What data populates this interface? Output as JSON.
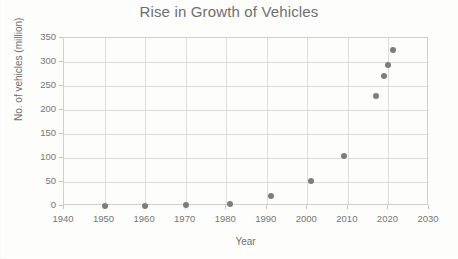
{
  "chart_data": {
    "type": "scatter",
    "title": "Rise in Growth of Vehicles",
    "xlabel": "Year",
    "ylabel": "No. of vehicles (million)",
    "xlim": [
      1940,
      2030
    ],
    "ylim": [
      0,
      350
    ],
    "xticks": [
      1940,
      1950,
      1960,
      1970,
      1980,
      1990,
      2000,
      2010,
      2020,
      2030
    ],
    "yticks": [
      0,
      50,
      100,
      150,
      200,
      250,
      300,
      350
    ],
    "xtick_labels": [
      "1940",
      "1950",
      "1960",
      "1970",
      "1980",
      "1990",
      "2000",
      "2010",
      "2020",
      "2030"
    ],
    "ytick_labels": [
      "0",
      "50",
      "100",
      "150",
      "200",
      "250",
      "300",
      "350"
    ],
    "grid": true,
    "legend": false,
    "marker_color": "#7d7d7d",
    "marker_shape": "circle",
    "axis_color": "#cfcfcf",
    "grid_color": "#dcdcdc",
    "text_color": "#6f6f6f",
    "series": [
      {
        "name": "No. of vehicles",
        "points": [
          {
            "x": 1950,
            "y": 0
          },
          {
            "x": 1960,
            "y": 1
          },
          {
            "x": 1970,
            "y": 2
          },
          {
            "x": 1981,
            "y": 4
          },
          {
            "x": 1991,
            "y": 20
          },
          {
            "x": 2001,
            "y": 53
          },
          {
            "x": 2009,
            "y": 104
          },
          {
            "x": 2017,
            "y": 230
          },
          {
            "x": 2019,
            "y": 271
          },
          {
            "x": 2020,
            "y": 293
          },
          {
            "x": 2021,
            "y": 324
          }
        ]
      }
    ]
  }
}
